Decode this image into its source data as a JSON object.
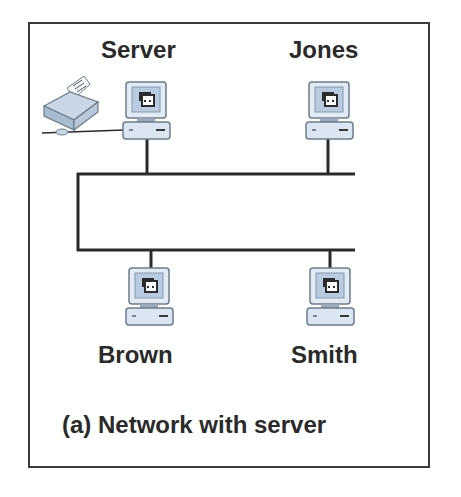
{
  "diagram": {
    "caption": "(a) Network with server",
    "nodes": [
      {
        "id": "server",
        "label": "Server",
        "type": "computer",
        "position": "top-left",
        "has_printer": true
      },
      {
        "id": "jones",
        "label": "Jones",
        "type": "computer",
        "position": "top-right"
      },
      {
        "id": "brown",
        "label": "Brown",
        "type": "computer",
        "position": "bottom-left"
      },
      {
        "id": "smith",
        "label": "Smith",
        "type": "computer",
        "position": "bottom-right"
      }
    ],
    "peripherals": [
      {
        "id": "printer",
        "type": "printer",
        "attached_to": "server",
        "icon": "printer-icon"
      }
    ],
    "topology": "bus (two parallel cables joined on left)",
    "colors": {
      "line": "#2a2a2a",
      "computer_body": "#dce6f2",
      "computer_screen": "#b9cbe0",
      "frame": "#3a3a3a"
    }
  }
}
